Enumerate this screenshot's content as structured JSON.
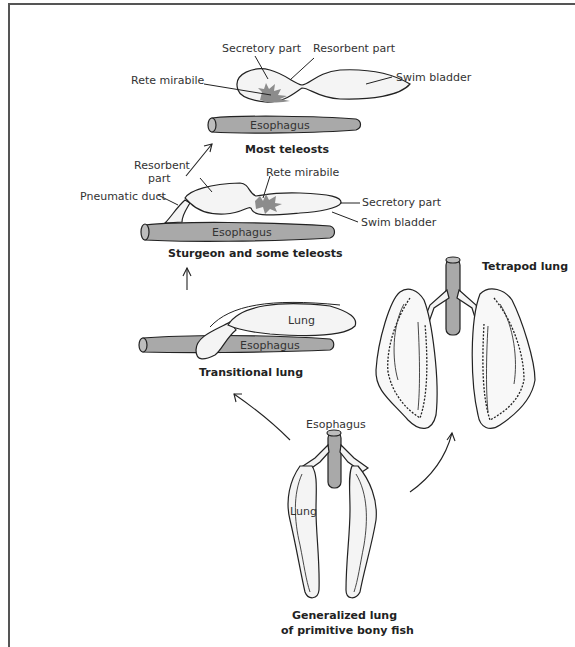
{
  "figure": {
    "colors": {
      "esophagus_fill": "#a9a9a9",
      "organ_fill": "#f4f4f4",
      "rete_fill": "#8c8c8c",
      "line": "#222222",
      "frame": "#555555"
    }
  },
  "most_teleosts": {
    "caption": "Most teleosts",
    "labels": {
      "secretory_part": "Secretory part",
      "resorbent_part": "Resorbent part",
      "rete_mirabile": "Rete mirabile",
      "swim_bladder": "Swim bladder",
      "esophagus": "Esophagus"
    }
  },
  "sturgeon": {
    "caption": "Sturgeon and some teleosts",
    "labels": {
      "resorbent_part_line1": "Resorbent",
      "resorbent_part_line2": "part",
      "rete_mirabile": "Rete mirabile",
      "pneumatic_duct": "Pneumatic duct",
      "secretory_part": "Secretory part",
      "swim_bladder": "Swim bladder",
      "esophagus": "Esophagus"
    }
  },
  "transitional": {
    "caption": "Transitional lung",
    "labels": {
      "lung": "Lung",
      "esophagus": "Esophagus"
    }
  },
  "tetrapod": {
    "caption": "Tetrapod lung"
  },
  "primitive": {
    "caption_line1": "Generalized lung",
    "caption_line2": "of primitive bony fish",
    "labels": {
      "esophagus": "Esophagus",
      "lung": "Lung"
    }
  },
  "arrows": [
    {
      "name": "sturgeon-to-teleosts",
      "direction": "up-right"
    },
    {
      "name": "transitional-to-sturgeon",
      "direction": "up"
    },
    {
      "name": "primitive-to-transitional",
      "direction": "up-left"
    },
    {
      "name": "primitive-to-tetrapod",
      "direction": "up-right"
    }
  ]
}
